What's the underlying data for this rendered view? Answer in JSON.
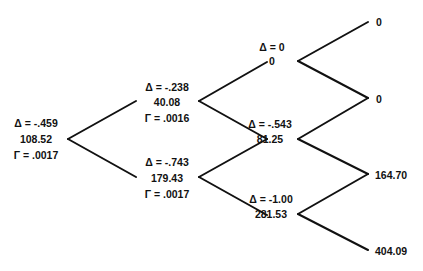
{
  "nodes": {
    "n0": {
      "delta": "Δ = -.459",
      "value": "108.52",
      "gamma": "Γ = .0017"
    },
    "u1": {
      "delta": "Δ = -.238",
      "value": "40.08",
      "gamma": "Γ = .0016"
    },
    "d1": {
      "delta": "Δ = -.743",
      "value": "179.43",
      "gamma": "Γ = .0017"
    },
    "uu2": {
      "delta": "Δ = 0",
      "value": "0"
    },
    "ud2": {
      "delta": "Δ = -.543",
      "value": "81.25"
    },
    "dd2": {
      "delta": "Δ = -1.00",
      "value": "281.53"
    },
    "uuu3": {
      "value": "0"
    },
    "uud3": {
      "value": "0"
    },
    "udd3": {
      "value": "164.70"
    },
    "ddd3": {
      "value": "404.09"
    }
  },
  "colors": {
    "line": "#111111",
    "text": "#111111",
    "background": "#ffffff"
  }
}
